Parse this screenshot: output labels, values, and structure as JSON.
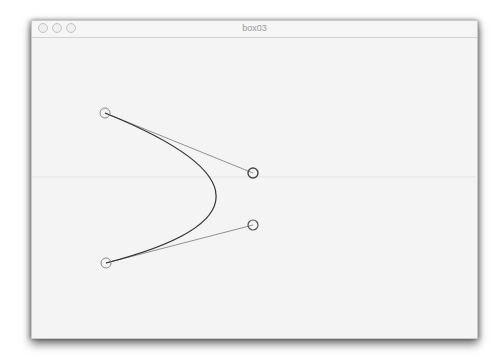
{
  "window": {
    "title": "box03",
    "traffic_lights": [
      "close-button",
      "minimize-button",
      "zoom-button"
    ]
  },
  "canvas": {
    "background": "#f4f4f4",
    "guide_line_y": 177,
    "bezier": {
      "p0": [
        105,
        113
      ],
      "c1": [
        253,
        173
      ],
      "c2": [
        253,
        225
      ],
      "p3": [
        106,
        263
      ],
      "stroke": "#333333"
    },
    "handle_color": "#555555",
    "control_point_radius": 5
  }
}
